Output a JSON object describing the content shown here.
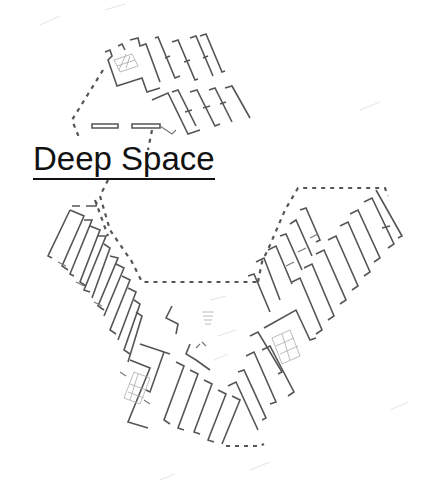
{
  "diagram": {
    "type": "architectural-floor-plan",
    "label": "Deep Space",
    "colors": {
      "background": "#ffffff",
      "label_text": "#111111",
      "linework": "#555555"
    }
  }
}
